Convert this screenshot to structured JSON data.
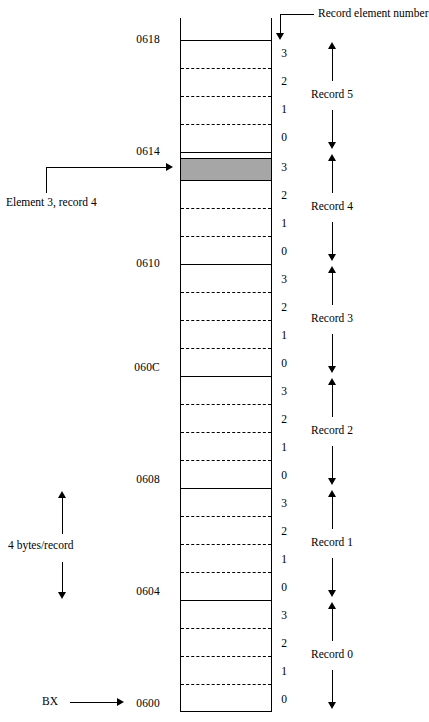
{
  "diagram": {
    "title_caption": "",
    "geometry": {
      "box_left": 180,
      "box_right": 272,
      "box_top": 40,
      "box_bottom": 712,
      "cell_height": 28,
      "records": 6,
      "elements_per_record": 4
    },
    "colors": {
      "line": "#000000",
      "highlight_fill": "#a6a6a6",
      "background": "#ffffff"
    },
    "addresses": [
      {
        "label": "0618",
        "y": 33
      },
      {
        "label": "0614",
        "y": 145
      },
      {
        "label": "0610",
        "y": 257
      },
      {
        "label": "060C",
        "y": 361
      },
      {
        "label": "0608",
        "y": 473
      },
      {
        "label": "0604",
        "y": 585
      },
      {
        "label": "0600",
        "y": 697
      }
    ],
    "element_numbers": [
      "3",
      "2",
      "1",
      "0"
    ],
    "element_number_column": [
      "3",
      "2",
      "1",
      "0",
      "3",
      "2",
      "1",
      "0",
      "3",
      "2",
      "1",
      "0",
      "3",
      "2",
      "1",
      "0",
      "3",
      "2",
      "1",
      "0",
      "3",
      "2",
      "1",
      "0"
    ],
    "records": [
      {
        "label": "Record 5",
        "top": 40,
        "bottom": 152
      },
      {
        "label": "Record 4",
        "top": 152,
        "bottom": 264
      },
      {
        "label": "Record 3",
        "top": 264,
        "bottom": 376
      },
      {
        "label": "Record 2",
        "top": 376,
        "bottom": 488
      },
      {
        "label": "Record 1",
        "top": 488,
        "bottom": 600
      },
      {
        "label": "Record 0",
        "top": 600,
        "bottom": 712
      }
    ],
    "highlight": {
      "description": "Element 3, record 4",
      "top": 158,
      "height": 22
    },
    "annotations": {
      "record_element_number": "Record element number",
      "element_record_callout": "Element 3, record 4",
      "bytes_per_record": "4 bytes/record",
      "base_register": "BX",
      "base_address": "0600"
    }
  }
}
